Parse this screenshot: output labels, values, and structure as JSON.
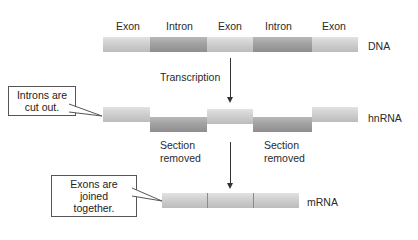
{
  "dna": {
    "segment_labels": [
      "Exon",
      "Intron",
      "Exon",
      "Intron",
      "Exon"
    ],
    "label": "DNA"
  },
  "step1": {
    "label": "Transcription"
  },
  "hnrna": {
    "label": "hnRNA",
    "removed_labels": [
      "Section\nremoved",
      "Section\nremoved"
    ],
    "callout": "Introns are\ncut out."
  },
  "mrna": {
    "label": "mRNA",
    "callout": "Exons are joined\ntogether."
  },
  "colors": {
    "exon": "#cfcfcf",
    "intron": "#a2a2a2",
    "line": "#333333"
  }
}
